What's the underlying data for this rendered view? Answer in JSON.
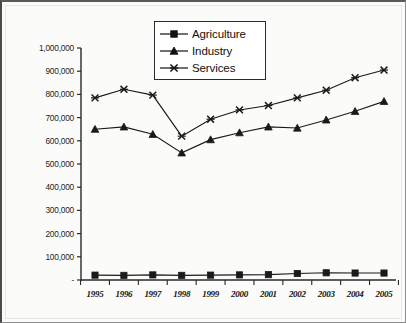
{
  "chart_data": {
    "type": "line",
    "title": "",
    "subtitle": "",
    "xlabel": "",
    "ylabel": "",
    "categories": [
      "1995",
      "1996",
      "1997",
      "1998",
      "1999",
      "2000",
      "2001",
      "2002",
      "2003",
      "2004",
      "2005"
    ],
    "ylim": [
      0,
      1000000
    ],
    "ytick_values": [
      0,
      100000,
      200000,
      300000,
      400000,
      500000,
      600000,
      700000,
      800000,
      900000,
      1000000
    ],
    "ytick_labels": [
      "-",
      "100,000",
      "200,000",
      "300,000",
      "400,000",
      "500,000",
      "600,000",
      "700,000",
      "800,000",
      "900,000",
      "1,000,000"
    ],
    "grid": false,
    "legend_position": "top-center",
    "series": [
      {
        "name": "Agriculture",
        "marker": "square",
        "color": "#1a1a1a",
        "values": [
          21000,
          20000,
          22000,
          20000,
          21000,
          22000,
          23000,
          28000,
          31000,
          30000,
          30000
        ]
      },
      {
        "name": "Industry",
        "marker": "triangle",
        "color": "#1a1a1a",
        "values": [
          650000,
          660000,
          628000,
          548000,
          605000,
          635000,
          660000,
          655000,
          690000,
          727000,
          770000
        ]
      },
      {
        "name": "Services",
        "marker": "cross",
        "color": "#1a1a1a",
        "values": [
          785000,
          822000,
          797000,
          620000,
          693000,
          733000,
          752000,
          785000,
          818000,
          872000,
          905000
        ]
      }
    ]
  },
  "legend": {
    "items": [
      {
        "label": "Agriculture",
        "marker": "square"
      },
      {
        "label": "Industry",
        "marker": "triangle"
      },
      {
        "label": "Services",
        "marker": "cross"
      }
    ]
  }
}
